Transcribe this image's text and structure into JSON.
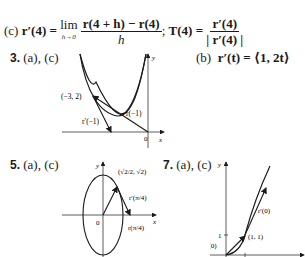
{
  "part_c": {
    "label": "(c)",
    "lhs": "r′(4) =",
    "lim_word": "lim",
    "lim_sub": "h→0",
    "frac1_num": "r(4 + h) − r(4)",
    "frac1_den": "h",
    "sep": ";",
    "t_lhs": "T(4) =",
    "frac2_num": "r′(4)",
    "frac2_den": "| r′(4) |"
  },
  "problem3": {
    "number": "3.",
    "parts": "(a), (c)",
    "part_b_label": "(b)",
    "part_b_expr": "r′(t) = ⟨1, 2t⟩",
    "figure": {
      "point_label": "(−3, 2)",
      "vector_r_label": "r(−1)",
      "vector_rprime_label": "r′(−1)",
      "origin_label": "0",
      "x_axis_label": "x",
      "y_axis_label": "y"
    }
  },
  "problem5": {
    "number": "5.",
    "parts": "(a), (c)",
    "figure": {
      "point_label": "(√2/2, √2)",
      "rprime_label": "r′(π/4)",
      "r_label": "r(π/4)",
      "origin_label": "0",
      "x_axis_label": "x",
      "y_axis_label": "y"
    }
  },
  "problem7": {
    "number": "7.",
    "parts": "(a), (c)",
    "figure": {
      "rprime_label": "r′(0)",
      "point_label": "(1, 1)",
      "r_label": "r(0)",
      "tick_label": "1",
      "y_axis_label": "y"
    }
  }
}
